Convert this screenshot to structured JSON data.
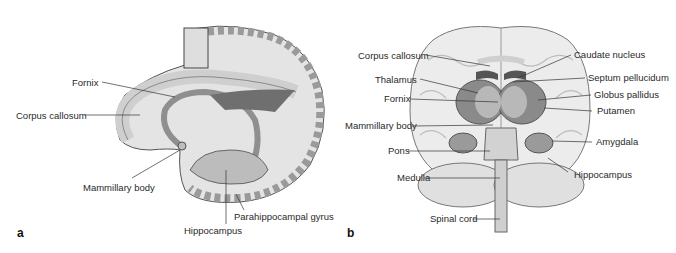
{
  "figure": {
    "panels": [
      {
        "letter": "a",
        "view": "lateral cut-away of limbic structures",
        "labels": {
          "fornix": "Fornix",
          "corpus_callosum": "Corpus callosum",
          "mammillary_body": "Mammillary body",
          "parahippocampal_gyrus": "Parahippocampal gyrus",
          "hippocampus": "Hippocampus"
        }
      },
      {
        "letter": "b",
        "view": "frontal transparent view of brain",
        "labels": {
          "corpus_callosum": "Corpus callosum",
          "thalamus": "Thalamus",
          "fornix": "Fornix",
          "mammillary_body": "Mammillary body",
          "pons": "Pons",
          "medulla": "Medulla",
          "spinal_cord": "Spinal cord",
          "caudate_nucleus": "Caudate nucleus",
          "septum_pellucidum": "Septum pellucidum",
          "globus_pallidus": "Globus pallidus",
          "putamen": "Putamen",
          "amygdala": "Amygdala",
          "hippocampus": "Hippocampus"
        }
      }
    ]
  },
  "colors": {
    "background": "#ffffff",
    "label_text": "#2a2a2a",
    "leader_line": "#333333",
    "tissue_light": "#e6e6e6",
    "tissue_mid": "#bdbdbd",
    "tissue_dark": "#7a7a7a"
  }
}
